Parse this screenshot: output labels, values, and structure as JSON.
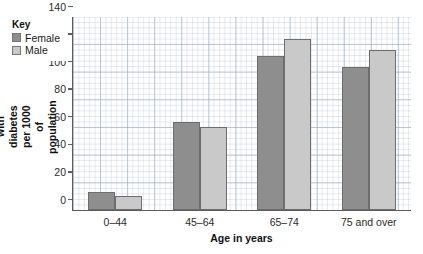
{
  "chart_data": {
    "type": "bar",
    "title": "",
    "xlabel": "Age in years",
    "ylabel": "Number with diabetes per 1000 of population",
    "categories": [
      "0–44",
      "45–64",
      "65–74",
      "75 and over"
    ],
    "series": [
      {
        "name": "Female",
        "color": "#8e8e8e",
        "values": [
          13,
          64,
          112,
          104
        ]
      },
      {
        "name": "Male",
        "color": "#c9c9c9",
        "values": [
          10,
          60,
          124,
          116
        ]
      }
    ],
    "ylim": [
      0,
      140
    ],
    "yticks": [
      0,
      20,
      40,
      60,
      80,
      100,
      120,
      140
    ],
    "ytick_labels": [
      "0",
      "20",
      "40",
      "60",
      "80",
      "100",
      "120",
      "140"
    ],
    "grid": true,
    "legend_position": "top-left"
  },
  "legend": {
    "title": "Key",
    "entries": [
      {
        "label": "Female",
        "swatch": "female-swatch"
      },
      {
        "label": "Male",
        "swatch": "male-swatch"
      }
    ]
  },
  "axis": {
    "y_label_line1": "Number with diabetes",
    "y_label_line2": "per 1000 of population",
    "x_label": "Age in years"
  }
}
